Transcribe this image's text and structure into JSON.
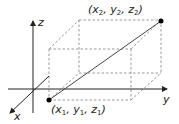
{
  "diagram": {
    "type": "3d-coordinate-box",
    "axes": {
      "x": {
        "label": "x"
      },
      "y": {
        "label": "y"
      },
      "z": {
        "label": "z"
      }
    },
    "points": [
      {
        "id": "p1",
        "label_parts": [
          "(x",
          "1",
          ",  y",
          "1",
          ",  z",
          "1",
          ")"
        ]
      },
      {
        "id": "p2",
        "label_parts": [
          "(x",
          "2",
          ",  y",
          "2",
          ",  z",
          "2",
          ")"
        ]
      }
    ],
    "colors": {
      "axis": "#222222",
      "dashed_box": "#999999",
      "segment": "#444444",
      "point": "#000000"
    }
  }
}
